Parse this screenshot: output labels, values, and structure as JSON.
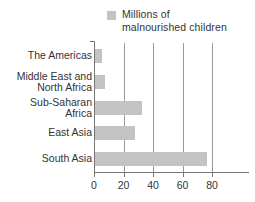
{
  "legend": {
    "swatch_color": "#c3c3c3",
    "label": "Millions of\nmalnourished children",
    "icon": "legend-swatch-icon"
  },
  "axis": {
    "tick_labels": [
      "0",
      "20",
      "40",
      "60",
      "80"
    ],
    "tick_values": [
      0,
      20,
      40,
      60,
      80
    ],
    "line_color": "#777777",
    "gridline_color": "#9a9a9a"
  },
  "categories": [
    {
      "label": "The Americas",
      "value": 5
    },
    {
      "label": "Middle East and\nNorth Africa",
      "value": 7
    },
    {
      "label": "Sub-Saharan\nAfrica",
      "value": 32
    },
    {
      "label": "East Asia",
      "value": 27
    },
    {
      "label": "South Asia",
      "value": 76
    }
  ],
  "chart_data": {
    "type": "bar",
    "orientation": "horizontal",
    "title": "",
    "subtitle": "",
    "xlabel": "",
    "ylabel": "",
    "categories": [
      "The Americas",
      "Middle East and North Africa",
      "Sub-Saharan Africa",
      "East Asia",
      "South Asia"
    ],
    "values": [
      5,
      7,
      32,
      27,
      76
    ],
    "series": [
      {
        "name": "Millions of malnourished children",
        "values": [
          5,
          7,
          32,
          27,
          76
        ],
        "color": "#c3c3c3"
      }
    ],
    "xlim": [
      0,
      80
    ],
    "xticks": [
      0,
      20,
      40,
      60,
      80
    ],
    "grid": "vertical",
    "legend_position": "top",
    "legend_entries": [
      "Millions of malnourished children"
    ],
    "annotations": []
  }
}
